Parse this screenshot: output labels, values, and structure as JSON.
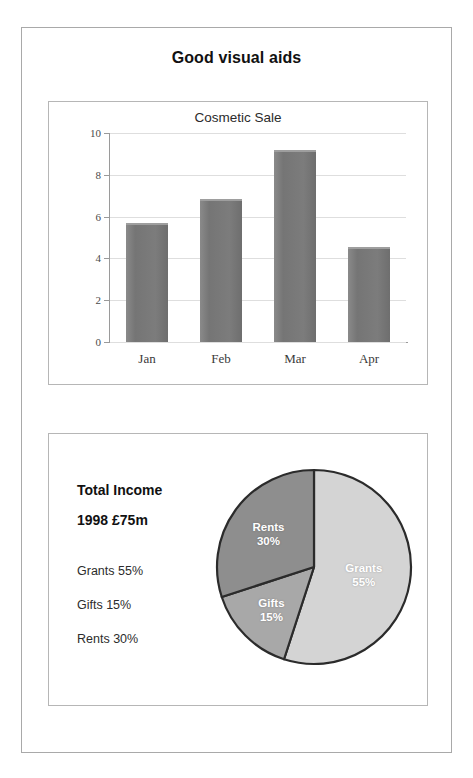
{
  "slide": {
    "title": "Good visual aids"
  },
  "bar_panel": {
    "name": "cosmetic-sale-bar-chart"
  },
  "pie_panel": {
    "heading_line_1": "Total Income",
    "heading_line_2": "1998 £75m",
    "legend": [
      "Grants 55%",
      "Gifts 15%",
      "Rents 30%"
    ]
  },
  "colors": {
    "page_border": "#a9a9a9",
    "panel_border": "#b6b6b6",
    "bar_fill": "#7a7a7a",
    "bar_top_highlight": "#9e9e9e",
    "gridline": "#dedede",
    "axis": "#9a9a9a",
    "pie_outline": "#2b2b2b",
    "slice_grants": "#d4d4d4",
    "slice_gifts": "#a8a8a8",
    "slice_rents": "#8e8e8e",
    "text_dark": "#111111"
  },
  "chart_data": [
    {
      "type": "bar",
      "title": "Cosmetic Sale",
      "categories": [
        "Jan",
        "Feb",
        "Mar",
        "Apr"
      ],
      "values": [
        5.7,
        6.85,
        9.2,
        4.55
      ],
      "xlabel": "",
      "ylabel": "",
      "ylim": [
        0,
        10
      ],
      "yticks": [
        0,
        2,
        4,
        6,
        8,
        10
      ],
      "grid": true,
      "legend": false,
      "series_color": "#7a7a7a"
    },
    {
      "type": "pie",
      "title": "Total Income 1998 £75m",
      "labels": [
        "Grants",
        "Gifts",
        "Rents"
      ],
      "values": [
        55,
        15,
        30
      ],
      "unit": "%",
      "total_label": "1998 £75m",
      "start_angle_deg": 0,
      "direction": "clockwise",
      "slice_colors": [
        "#d4d4d4",
        "#a8a8a8",
        "#8e8e8e"
      ],
      "data_labels": [
        "Grants\n55%",
        "Gifts\n15%",
        "Rents\n30%"
      ],
      "legend": [
        "Grants 55%",
        "Gifts 15%",
        "Rents 30%"
      ],
      "legend_position": "left"
    }
  ]
}
